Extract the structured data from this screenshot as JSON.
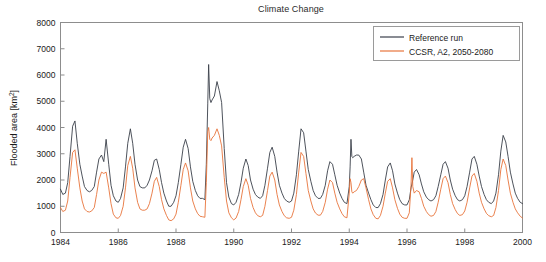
{
  "figure": {
    "title": "Climate Change",
    "background_color": "#ffffff"
  },
  "legend": {
    "position": "top-right",
    "entries": [
      {
        "label": "Reference run",
        "color": "#3a3f4a"
      },
      {
        "label": "CCSR, A2, 2050-2080",
        "color": "#e8743b"
      }
    ]
  },
  "axes": {
    "x_label": "",
    "y_label": "Flooded area [km2]",
    "y_label_base": "Flooded area [km",
    "y_label_exponent": "2",
    "y_label_tail": "]",
    "x_ticks": [
      "1984",
      "1986",
      "1988",
      "1990",
      "1992",
      "1994",
      "1996",
      "1998",
      "2000"
    ],
    "y_ticks": [
      "0",
      "1000",
      "2000",
      "3000",
      "4000",
      "5000",
      "6000",
      "7000",
      "8000"
    ],
    "x_range": [
      1984,
      2000
    ],
    "y_range": [
      0,
      8000
    ],
    "tick_direction": "in",
    "grid": false,
    "box": true
  },
  "chart_data": {
    "type": "line",
    "title": "Climate Change",
    "xlabel": "",
    "ylabel": "Flooded area [km2]",
    "xlim": [
      1984,
      2000
    ],
    "ylim": [
      0,
      8000
    ],
    "grid": false,
    "legend_position": "upper right",
    "x_unit": "year",
    "y_unit": "km2",
    "series": [
      {
        "name": "Reference run",
        "color": "#3a3f4a",
        "x": [
          1984.0,
          1984.08,
          1984.17,
          1984.25,
          1984.33,
          1984.42,
          1984.5,
          1984.58,
          1984.67,
          1984.75,
          1984.83,
          1984.92,
          1985.0,
          1985.08,
          1985.17,
          1985.25,
          1985.33,
          1985.42,
          1985.5,
          1985.58,
          1985.67,
          1985.75,
          1985.83,
          1985.92,
          1986.0,
          1986.08,
          1986.17,
          1986.25,
          1986.33,
          1986.42,
          1986.5,
          1986.58,
          1986.67,
          1986.75,
          1986.83,
          1986.92,
          1987.0,
          1987.08,
          1987.17,
          1987.25,
          1987.33,
          1987.42,
          1987.5,
          1987.58,
          1987.67,
          1987.75,
          1987.83,
          1987.92,
          1988.0,
          1988.08,
          1988.17,
          1988.25,
          1988.33,
          1988.42,
          1988.5,
          1988.58,
          1988.67,
          1988.75,
          1988.83,
          1988.92,
          1989.0,
          1989.05,
          1989.1,
          1989.13,
          1989.17,
          1989.21,
          1989.25,
          1989.33,
          1989.42,
          1989.5,
          1989.58,
          1989.67,
          1989.75,
          1989.83,
          1989.92,
          1990.0,
          1990.08,
          1990.17,
          1990.25,
          1990.33,
          1990.42,
          1990.5,
          1990.58,
          1990.67,
          1990.75,
          1990.83,
          1990.92,
          1991.0,
          1991.08,
          1991.17,
          1991.25,
          1991.33,
          1991.42,
          1991.5,
          1991.58,
          1991.67,
          1991.75,
          1991.83,
          1991.92,
          1992.0,
          1992.08,
          1992.17,
          1992.25,
          1992.33,
          1992.42,
          1992.5,
          1992.58,
          1992.67,
          1992.75,
          1992.83,
          1992.92,
          1993.0,
          1993.08,
          1993.17,
          1993.25,
          1993.33,
          1993.42,
          1993.5,
          1993.58,
          1993.67,
          1993.75,
          1993.83,
          1993.92,
          1994.0,
          1994.03,
          1994.06,
          1994.09,
          1994.12,
          1994.17,
          1994.25,
          1994.33,
          1994.42,
          1994.5,
          1994.58,
          1994.67,
          1994.75,
          1994.83,
          1994.92,
          1995.0,
          1995.08,
          1995.17,
          1995.25,
          1995.33,
          1995.42,
          1995.5,
          1995.58,
          1995.67,
          1995.75,
          1995.83,
          1995.92,
          1996.0,
          1996.08,
          1996.14,
          1996.17,
          1996.2,
          1996.25,
          1996.33,
          1996.42,
          1996.5,
          1996.58,
          1996.67,
          1996.75,
          1996.83,
          1996.92,
          1997.0,
          1997.08,
          1997.17,
          1997.25,
          1997.33,
          1997.42,
          1997.5,
          1997.58,
          1997.67,
          1997.75,
          1997.83,
          1997.92,
          1998.0,
          1998.08,
          1998.17,
          1998.25,
          1998.33,
          1998.42,
          1998.5,
          1998.58,
          1998.67,
          1998.75,
          1998.83,
          1998.92,
          1999.0,
          1999.08,
          1999.17,
          1999.25,
          1999.33,
          1999.42,
          1999.5,
          1999.58,
          1999.67,
          1999.75,
          1999.83,
          1999.92,
          2000.0
        ],
        "y": [
          1650,
          1450,
          1500,
          1900,
          2900,
          4050,
          4250,
          3400,
          2600,
          2150,
          1750,
          1600,
          1550,
          1600,
          1750,
          2300,
          2800,
          2950,
          2700,
          3550,
          2600,
          1800,
          1400,
          1200,
          1150,
          1300,
          1700,
          2500,
          3400,
          3950,
          3400,
          2600,
          2000,
          1750,
          1700,
          1700,
          1800,
          2000,
          2350,
          2750,
          2800,
          2400,
          1900,
          1500,
          1200,
          1000,
          1000,
          1150,
          1400,
          1900,
          2600,
          3250,
          3550,
          3200,
          2500,
          1950,
          1600,
          1400,
          1300,
          1300,
          1250,
          2600,
          4900,
          6400,
          5100,
          4950,
          5050,
          5200,
          5750,
          5400,
          4950,
          3200,
          1900,
          1350,
          1100,
          1050,
          1150,
          1450,
          1900,
          2450,
          2800,
          2550,
          2000,
          1650,
          1450,
          1350,
          1300,
          1400,
          1800,
          2450,
          3050,
          3250,
          2900,
          2300,
          1800,
          1500,
          1300,
          1200,
          1150,
          1200,
          1500,
          2200,
          3100,
          3950,
          3800,
          3100,
          2400,
          1950,
          1600,
          1400,
          1300,
          1300,
          1450,
          1800,
          2350,
          2700,
          2600,
          2200,
          1800,
          1500,
          1300,
          1150,
          1100,
          1750,
          2500,
          3550,
          2900,
          2850,
          2900,
          2950,
          2950,
          2800,
          2300,
          1800,
          1500,
          1250,
          1050,
          950,
          950,
          1100,
          1450,
          2000,
          2500,
          2650,
          2350,
          1850,
          1500,
          1250,
          1100,
          1050,
          1050,
          1250,
          1700,
          1850,
          2000,
          2300,
          2400,
          2200,
          1850,
          1550,
          1350,
          1250,
          1200,
          1250,
          1400,
          1750,
          2200,
          2600,
          2700,
          2450,
          2000,
          1650,
          1400,
          1250,
          1200,
          1250,
          1400,
          1750,
          2300,
          2800,
          2900,
          2600,
          2150,
          1750,
          1450,
          1250,
          1150,
          1100,
          1200,
          1500,
          2200,
          3100,
          3700,
          3450,
          2900,
          2300,
          1850,
          1500,
          1300,
          1150,
          1100
        ]
      },
      {
        "name": "CCSR, A2, 2050-2080",
        "color": "#e8743b",
        "x": [
          1984.0,
          1984.08,
          1984.17,
          1984.25,
          1984.33,
          1984.42,
          1984.5,
          1984.58,
          1984.67,
          1984.75,
          1984.83,
          1984.92,
          1985.0,
          1985.08,
          1985.17,
          1985.25,
          1985.33,
          1985.42,
          1985.5,
          1985.58,
          1985.67,
          1985.75,
          1985.83,
          1985.92,
          1986.0,
          1986.08,
          1986.17,
          1986.25,
          1986.33,
          1986.42,
          1986.5,
          1986.58,
          1986.67,
          1986.75,
          1986.83,
          1986.92,
          1987.0,
          1987.08,
          1987.17,
          1987.25,
          1987.33,
          1987.42,
          1987.5,
          1987.58,
          1987.67,
          1987.75,
          1987.83,
          1987.92,
          1988.0,
          1988.08,
          1988.17,
          1988.25,
          1988.33,
          1988.42,
          1988.5,
          1988.58,
          1988.67,
          1988.75,
          1988.83,
          1988.92,
          1989.0,
          1989.05,
          1989.1,
          1989.13,
          1989.17,
          1989.21,
          1989.25,
          1989.33,
          1989.42,
          1989.5,
          1989.58,
          1989.67,
          1989.75,
          1989.83,
          1989.92,
          1990.0,
          1990.08,
          1990.17,
          1990.25,
          1990.33,
          1990.42,
          1990.5,
          1990.58,
          1990.67,
          1990.75,
          1990.83,
          1990.92,
          1991.0,
          1991.08,
          1991.17,
          1991.25,
          1991.33,
          1991.42,
          1991.5,
          1991.58,
          1991.67,
          1991.75,
          1991.83,
          1991.92,
          1992.0,
          1992.08,
          1992.17,
          1992.25,
          1992.33,
          1992.42,
          1992.5,
          1992.58,
          1992.67,
          1992.75,
          1992.83,
          1992.92,
          1993.0,
          1993.08,
          1993.17,
          1993.25,
          1993.33,
          1993.42,
          1993.5,
          1993.58,
          1993.67,
          1993.75,
          1993.83,
          1993.92,
          1994.0,
          1994.03,
          1994.06,
          1994.09,
          1994.12,
          1994.17,
          1994.25,
          1994.33,
          1994.42,
          1994.5,
          1994.58,
          1994.67,
          1994.75,
          1994.83,
          1994.92,
          1995.0,
          1995.08,
          1995.17,
          1995.25,
          1995.33,
          1995.42,
          1995.5,
          1995.58,
          1995.67,
          1995.75,
          1995.83,
          1995.92,
          1996.0,
          1996.08,
          1996.14,
          1996.17,
          1996.2,
          1996.25,
          1996.33,
          1996.42,
          1996.5,
          1996.58,
          1996.67,
          1996.75,
          1996.83,
          1996.92,
          1997.0,
          1997.08,
          1997.17,
          1997.25,
          1997.33,
          1997.42,
          1997.5,
          1997.58,
          1997.67,
          1997.75,
          1997.83,
          1997.92,
          1998.0,
          1998.08,
          1998.17,
          1998.25,
          1998.33,
          1998.42,
          1998.5,
          1998.58,
          1998.67,
          1998.75,
          1998.83,
          1998.92,
          1999.0,
          1999.08,
          1999.17,
          1999.25,
          1999.33,
          1999.42,
          1999.5,
          1999.58,
          1999.67,
          1999.75,
          1999.83,
          1999.92,
          2000.0
        ],
        "y": [
          950,
          800,
          850,
          1200,
          2100,
          3050,
          3150,
          2450,
          1700,
          1200,
          900,
          800,
          780,
          820,
          950,
          1450,
          2000,
          2300,
          2250,
          2300,
          1700,
          1100,
          700,
          560,
          540,
          650,
          1000,
          1700,
          2550,
          2900,
          2450,
          1700,
          1150,
          900,
          850,
          850,
          900,
          1100,
          1500,
          1950,
          2100,
          1750,
          1250,
          900,
          650,
          480,
          450,
          520,
          700,
          1150,
          1800,
          2400,
          2650,
          2350,
          1700,
          1200,
          900,
          720,
          620,
          600,
          580,
          1900,
          3850,
          4000,
          3550,
          3500,
          3600,
          3700,
          3950,
          3700,
          3300,
          2100,
          1200,
          750,
          560,
          480,
          550,
          800,
          1250,
          1750,
          2050,
          1800,
          1300,
          950,
          750,
          640,
          600,
          650,
          1000,
          1600,
          2150,
          2300,
          2000,
          1450,
          1050,
          800,
          640,
          560,
          540,
          580,
          850,
          1450,
          2300,
          3050,
          2900,
          2250,
          1600,
          1200,
          900,
          740,
          660,
          660,
          800,
          1150,
          1650,
          2000,
          1900,
          1500,
          1150,
          900,
          720,
          600,
          560,
          1500,
          2050,
          1900,
          1550,
          1500,
          1550,
          1600,
          1750,
          2000,
          2050,
          1700,
          1250,
          900,
          680,
          540,
          520,
          650,
          1000,
          1500,
          1950,
          2050,
          1700,
          1250,
          920,
          700,
          580,
          540,
          540,
          750,
          1800,
          2850,
          1750,
          1500,
          1600,
          1550,
          1300,
          1000,
          800,
          680,
          620,
          650,
          800,
          1150,
          1650,
          2050,
          2150,
          1900,
          1450,
          1100,
          870,
          720,
          650,
          680,
          820,
          1150,
          1700,
          2150,
          2250,
          1950,
          1500,
          1150,
          900,
          730,
          640,
          600,
          650,
          950,
          1600,
          2400,
          2800,
          2550,
          2000,
          1500,
          1150,
          900,
          750,
          620,
          550
        ]
      }
    ]
  }
}
